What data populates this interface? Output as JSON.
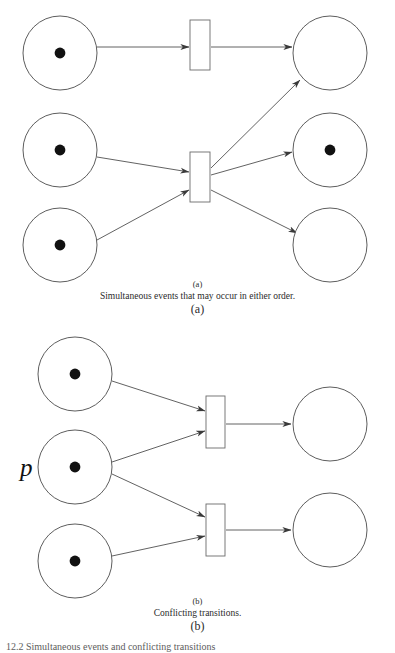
{
  "figure": {
    "footnote": "12.2 Simultaneous events and conflicting transitions",
    "panels": [
      {
        "id": "a",
        "tag_above": "(a)",
        "caption": "Simultaneous events that may occur in either order.",
        "tag_below": "(a)",
        "places": [
          {
            "name": "place-a-in-1",
            "cx": 60,
            "cy": 53,
            "r": 37,
            "tokens": 1,
            "label": ""
          },
          {
            "name": "place-a-in-2",
            "cx": 60,
            "cy": 150,
            "r": 37,
            "tokens": 1,
            "label": ""
          },
          {
            "name": "place-a-in-3",
            "cx": 60,
            "cy": 245,
            "r": 37,
            "tokens": 1,
            "label": ""
          },
          {
            "name": "place-a-out-1",
            "cx": 330,
            "cy": 53,
            "r": 37,
            "tokens": 0,
            "label": ""
          },
          {
            "name": "place-a-out-2",
            "cx": 330,
            "cy": 150,
            "r": 37,
            "tokens": 1,
            "label": ""
          },
          {
            "name": "place-a-out-3",
            "cx": 330,
            "cy": 245,
            "r": 37,
            "tokens": 0,
            "label": ""
          }
        ],
        "transitions": [
          {
            "name": "transition-a-top",
            "x": 190,
            "y": 20,
            "w": 20,
            "h": 50
          },
          {
            "name": "transition-a-mid",
            "x": 190,
            "y": 152,
            "w": 20,
            "h": 50
          }
        ],
        "arcs": [
          {
            "name": "arc-a-in1-to-ttop",
            "x1": 97,
            "y1": 47,
            "x2": 189,
            "y2": 47
          },
          {
            "name": "arc-a-ttop-to-out1",
            "x1": 211,
            "y1": 47,
            "x2": 292,
            "y2": 47
          },
          {
            "name": "arc-a-in2-to-tmid",
            "x1": 97,
            "y1": 157,
            "x2": 189,
            "y2": 172
          },
          {
            "name": "arc-a-in3-to-tmid",
            "x1": 97,
            "y1": 240,
            "x2": 189,
            "y2": 190
          },
          {
            "name": "arc-a-tmid-to-out1",
            "x1": 211,
            "y1": 168,
            "x2": 300,
            "y2": 80
          },
          {
            "name": "arc-a-tmid-to-out2",
            "x1": 211,
            "y1": 175,
            "x2": 292,
            "y2": 152
          },
          {
            "name": "arc-a-tmid-to-out3",
            "x1": 211,
            "y1": 190,
            "x2": 297,
            "y2": 233
          }
        ]
      },
      {
        "id": "b",
        "tag_above": "(b)",
        "caption": "Conflicting transitions.",
        "tag_below": "(b)",
        "places": [
          {
            "name": "place-b-in-1",
            "cx": 75,
            "cy": 374,
            "r": 37,
            "tokens": 1,
            "label": ""
          },
          {
            "name": "place-b-in-2",
            "cx": 75,
            "cy": 467,
            "r": 37,
            "tokens": 1,
            "label": "p"
          },
          {
            "name": "place-b-in-3",
            "cx": 75,
            "cy": 561,
            "r": 37,
            "tokens": 1,
            "label": ""
          },
          {
            "name": "place-b-out-1",
            "cx": 330,
            "cy": 424,
            "r": 37,
            "tokens": 0,
            "label": ""
          },
          {
            "name": "place-b-out-2",
            "cx": 330,
            "cy": 530,
            "r": 37,
            "tokens": 0,
            "label": ""
          }
        ],
        "transitions": [
          {
            "name": "transition-b-top",
            "x": 206,
            "y": 396,
            "w": 19,
            "h": 52
          },
          {
            "name": "transition-b-bottom",
            "x": 206,
            "y": 504,
            "w": 19,
            "h": 52
          }
        ],
        "arcs": [
          {
            "name": "arc-b-in1-to-ttop",
            "x1": 112,
            "y1": 381,
            "x2": 205,
            "y2": 411
          },
          {
            "name": "arc-b-in2-to-ttop",
            "x1": 112,
            "y1": 462,
            "x2": 205,
            "y2": 431
          },
          {
            "name": "arc-b-in2-to-tbot",
            "x1": 112,
            "y1": 474,
            "x2": 205,
            "y2": 517
          },
          {
            "name": "arc-b-in3-to-tbot",
            "x1": 112,
            "y1": 556,
            "x2": 205,
            "y2": 536
          },
          {
            "name": "arc-b-ttop-to-out1",
            "x1": 226,
            "y1": 424,
            "x2": 291,
            "y2": 424
          },
          {
            "name": "arc-b-tbot-to-out2",
            "x1": 226,
            "y1": 530,
            "x2": 291,
            "y2": 530
          }
        ],
        "place_labels": [
          {
            "name": "place-label-p",
            "text": "p",
            "x": 20,
            "y": 476
          }
        ]
      }
    ]
  },
  "colors": {
    "stroke": "#4b4b4b",
    "arc": "#3a3a3a",
    "token": "#111111",
    "background": "#ffffff"
  }
}
